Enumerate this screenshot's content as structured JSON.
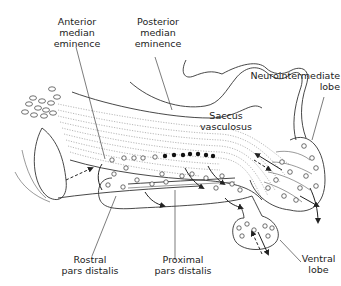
{
  "figure": {
    "labels": {
      "anterior_median_eminence": "Anterior\nmedian\neminence",
      "posterior_median_eminence": "Posterior\nmedian\neminence",
      "neurointermediate_lobe": "Neurointermediate\nlobe",
      "saccus_vasculosus": "Saccus\nvasculosus",
      "rostral_pars_distalis": "Rostral\npars distalis",
      "proximal_pars_distalis": "Proximal\npars distalis",
      "ventral_lobe": "Ventral\nlobe"
    },
    "colors": {
      "line": "#333333",
      "fiber": "#888888",
      "background": "#ffffff"
    }
  }
}
